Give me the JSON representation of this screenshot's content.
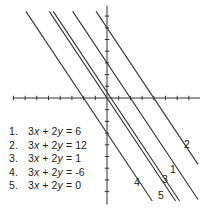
{
  "figure": {
    "background": "#ffffff",
    "axis_color": "#333333",
    "line_color": "#333333",
    "text_color": "#1c1c1c"
  },
  "chart_data": {
    "type": "line",
    "equation_family": "3x + 2y = c",
    "slope": -1.5,
    "grid": false,
    "x_axis": {
      "min": -8.05,
      "max": 7.95,
      "ticks": [
        -8,
        -7,
        -6,
        -5,
        -4,
        -3,
        -2,
        -1,
        1,
        2,
        3,
        4,
        5,
        6,
        7
      ]
    },
    "y_axis": {
      "min": -9.1,
      "max": 7.9,
      "ticks": [
        -8,
        -7,
        -6,
        -5,
        -4,
        -3,
        -2,
        -1,
        1,
        2,
        3,
        4,
        5,
        6,
        7
      ]
    },
    "lines": [
      {
        "label": "1",
        "c": 6,
        "x_intercept": 2,
        "y_intercept": 3,
        "label_px": [
          170,
          173
        ]
      },
      {
        "label": "2",
        "c": 12,
        "x_intercept": 4,
        "y_intercept": 6,
        "label_px": [
          184,
          148
        ]
      },
      {
        "label": "3",
        "c": 1,
        "x_intercept": 0.333,
        "y_intercept": 0.5,
        "label_px": [
          162,
          183
        ]
      },
      {
        "label": "4",
        "c": -6,
        "x_intercept": -2,
        "y_intercept": -3,
        "label_px": [
          134,
          186
        ]
      },
      {
        "label": "5",
        "c": 0,
        "x_intercept": 0,
        "y_intercept": 0,
        "label_px": [
          158,
          199
        ]
      }
    ],
    "layout": {
      "origin_px": [
        107,
        98
      ],
      "unit_px": 11.7,
      "clip_x": [
        -8.05,
        7.78
      ],
      "clip_y": [
        -8.8,
        7.4
      ],
      "tick_half_px": 2.2
    }
  },
  "legend": {
    "items": [
      {
        "num": "1.",
        "coef1": "3",
        "var1": "x",
        "middle": " + 2",
        "var2": "y",
        "rhs": " = 6"
      },
      {
        "num": "2.",
        "coef1": "3",
        "var1": "x",
        "middle": " + 2",
        "var2": "y",
        "rhs": " = 12"
      },
      {
        "num": "3.",
        "coef1": "3",
        "var1": "x",
        "middle": " + 2",
        "var2": "y",
        "rhs": " = 1"
      },
      {
        "num": "4.",
        "coef1": "3",
        "var1": "x",
        "middle": " + 2",
        "var2": "y",
        "rhs": " = -6"
      },
      {
        "num": "5.",
        "coef1": "3",
        "var1": "x",
        "middle": " + 2",
        "var2": "y",
        "rhs": " = 0"
      }
    ]
  }
}
